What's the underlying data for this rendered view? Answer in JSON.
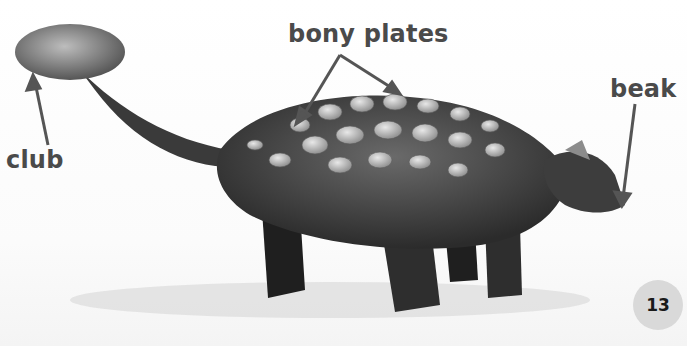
{
  "page": {
    "labels": {
      "bony_plates": "bony plates",
      "club": "club",
      "beak": "beak"
    },
    "page_number": "13"
  },
  "colors": {
    "label_text": "#4a4a4a",
    "arrow": "#555555",
    "page_badge": "#d9d9d9",
    "background": "#ffffff"
  }
}
